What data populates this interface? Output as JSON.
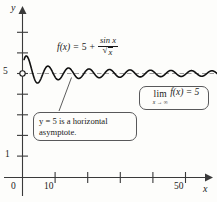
{
  "figure": {
    "background_color": "#fdfdfb",
    "curve_color": "#111111",
    "asymptote_color": "#9a9a9a",
    "axis_color": "#3a3a3a"
  },
  "axes": {
    "x_axis_label": "x",
    "y_axis_label": "y",
    "x_ticks": [
      {
        "value": 10,
        "label": "10"
      },
      {
        "value": 20,
        "label": ""
      },
      {
        "value": 30,
        "label": ""
      },
      {
        "value": 40,
        "label": ""
      },
      {
        "value": 50,
        "label": "50"
      }
    ],
    "y_ticks": [
      {
        "value": 1,
        "label": "1"
      },
      {
        "value": 2,
        "label": ""
      },
      {
        "value": 3,
        "label": ""
      },
      {
        "value": 4,
        "label": ""
      },
      {
        "value": 5,
        "label": "5"
      },
      {
        "value": 6,
        "label": ""
      },
      {
        "value": 7,
        "label": ""
      }
    ],
    "origin_label": "0"
  },
  "formula": {
    "function_name": "f",
    "variable": "x",
    "lhs": "f(x)",
    "equals": "=",
    "constant": "5",
    "plus": "+",
    "numerator": "sin x",
    "denominator_radical": "√",
    "denominator_arg": "x",
    "full_text": "f(x) = 5 + sin x / √x"
  },
  "callouts": {
    "asymptote": {
      "line1": "y = 5 is a horizontal",
      "line2": "asymptote."
    },
    "limit": {
      "operator": "lim",
      "subscript": "x → ∞",
      "body": "f(x)  =  5"
    }
  },
  "chart_data": {
    "type": "line",
    "title": "",
    "subtitle": "",
    "xlabel": "x",
    "ylabel": "y",
    "xlim": [
      0,
      60
    ],
    "ylim": [
      0,
      7.3
    ],
    "grid": false,
    "legend_position": "none",
    "series": [
      {
        "name": "f(x) = 5 + sin x / sqrt(x)",
        "equation": "5 + sin(x)/sqrt(x)",
        "x_start": 0.5,
        "x_end": 60,
        "samples": 1400,
        "color": "#111111",
        "linewidth": 1.6
      },
      {
        "name": "horizontal asymptote y = 5",
        "type": "hline",
        "y": 5,
        "style": "dashed",
        "color": "#9a9a9a",
        "linewidth": 1.0
      }
    ],
    "annotations": [
      {
        "name": "open-circle-at-y-intercept",
        "x": 0,
        "y": 5,
        "marker": "open-circle"
      },
      {
        "name": "asymptote-callout",
        "text": "y = 5 is a horizontal asymptote.",
        "points_to": {
          "x": 11.5,
          "y": 5.25
        }
      },
      {
        "name": "limit-callout",
        "text": "lim x→∞ f(x) = 5"
      },
      {
        "name": "function-label",
        "text": "f(x) = 5 + sin x / √x"
      }
    ],
    "sampled_points": [
      {
        "x": 0.5,
        "y": 5.678
      },
      {
        "x": 1.0,
        "y": 5.841
      },
      {
        "x": 1.6,
        "y": 5.79
      },
      {
        "x": 2.4,
        "y": 5.437
      },
      {
        "x": 3.2,
        "y": 4.967
      },
      {
        "x": 4.0,
        "y": 4.622
      },
      {
        "x": 4.7,
        "y": 4.54
      },
      {
        "x": 5.5,
        "y": 4.7
      },
      {
        "x": 6.3,
        "y": 5.007
      },
      {
        "x": 7.2,
        "y": 5.307
      },
      {
        "x": 8.0,
        "y": 5.35
      },
      {
        "x": 8.8,
        "y": 5.2
      },
      {
        "x": 9.6,
        "y": 4.935
      },
      {
        "x": 10.5,
        "y": 4.726
      },
      {
        "x": 11.3,
        "y": 4.706
      },
      {
        "x": 12.0,
        "y": 4.845
      },
      {
        "x": 13.0,
        "y": 5.116
      },
      {
        "x": 14.0,
        "y": 5.264
      },
      {
        "x": 15.0,
        "y": 5.168
      },
      {
        "x": 16.0,
        "y": 4.928
      },
      {
        "x": 17.0,
        "y": 4.767
      },
      {
        "x": 18.0,
        "y": 4.823
      },
      {
        "x": 20.0,
        "y": 5.204
      },
      {
        "x": 22.0,
        "y": 4.998
      },
      {
        "x": 24.0,
        "y": 4.816
      },
      {
        "x": 26.0,
        "y": 5.152
      },
      {
        "x": 28.0,
        "y": 5.05
      },
      {
        "x": 30.0,
        "y": 4.82
      },
      {
        "x": 33.0,
        "y": 5.171
      },
      {
        "x": 36.0,
        "y": 4.841
      },
      {
        "x": 40.0,
        "y": 5.118
      },
      {
        "x": 45.0,
        "y": 5.127
      },
      {
        "x": 50.0,
        "y": 4.963
      },
      {
        "x": 55.0,
        "y": 4.866
      },
      {
        "x": 60.0,
        "y": 4.959
      }
    ]
  }
}
